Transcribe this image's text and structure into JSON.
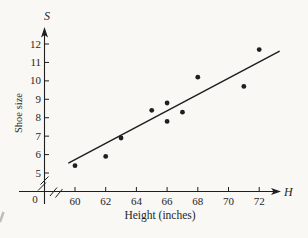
{
  "background_color": "#f9f8f5",
  "ink_color": "#1f1f1f",
  "artifact_color": "#8f8f8c",
  "chart_data": {
    "type": "scatter",
    "title": "",
    "xlabel": "Height (inches)",
    "ylabel": "Shoe size",
    "x_axis_symbol": "H",
    "y_axis_symbol": "S",
    "origin_label": "0",
    "x_ticks": [
      60,
      62,
      64,
      66,
      68,
      70,
      72
    ],
    "y_ticks": [
      5,
      6,
      7,
      8,
      9,
      10,
      11,
      12
    ],
    "xlim": [
      58.5,
      73.5
    ],
    "ylim": [
      4.5,
      12.8
    ],
    "grid": false,
    "legend": false,
    "axis_break_x": true,
    "axis_break_y": true,
    "points": [
      {
        "height": 60,
        "shoe_size": 5.4
      },
      {
        "height": 62,
        "shoe_size": 5.9
      },
      {
        "height": 63,
        "shoe_size": 6.9
      },
      {
        "height": 65,
        "shoe_size": 8.4
      },
      {
        "height": 66,
        "shoe_size": 8.8
      },
      {
        "height": 66,
        "shoe_size": 7.8
      },
      {
        "height": 67,
        "shoe_size": 8.3
      },
      {
        "height": 68,
        "shoe_size": 10.2
      },
      {
        "height": 71,
        "shoe_size": 9.7
      },
      {
        "height": 72,
        "shoe_size": 11.7
      }
    ],
    "trendline": {
      "from": {
        "height": 59.6,
        "shoe_size": 5.55
      },
      "to": {
        "height": 73.3,
        "shoe_size": 11.6
      }
    }
  }
}
